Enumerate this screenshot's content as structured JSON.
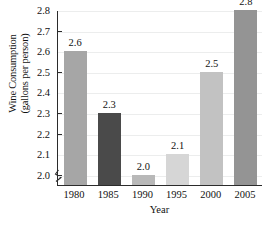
{
  "chart_data": {
    "type": "bar",
    "title": "",
    "categories": [
      "1980",
      "1985",
      "1990",
      "1995",
      "2000",
      "2005"
    ],
    "values": [
      2.6,
      2.3,
      2.0,
      2.1,
      2.5,
      2.8
    ],
    "value_labels": [
      "2.6",
      "2.3",
      "2.0",
      "2.1",
      "2.5",
      "2.8"
    ],
    "xlabel": "Year",
    "ylabel_line1": "Wine Consumption",
    "ylabel_line2": "(gallons per person)",
    "ylim": [
      1.95,
      2.8
    ],
    "yticks": [
      2.0,
      2.1,
      2.2,
      2.3,
      2.4,
      2.5,
      2.6,
      2.7,
      2.8
    ],
    "ytick_labels": [
      "2.0",
      "2.1",
      "2.2",
      "2.3",
      "2.4",
      "2.5",
      "2.6",
      "2.7",
      "2.8"
    ],
    "grid": true,
    "legend": "none",
    "axis_break": true,
    "bar_colors": [
      "#a6a6a6",
      "#4a4a4a",
      "#b8b8b8",
      "#d6d6d6",
      "#c2c2c2",
      "#949494"
    ]
  },
  "caption_remnant": ""
}
